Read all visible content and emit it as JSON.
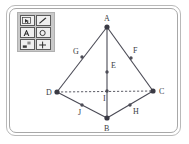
{
  "window": {
    "title": "Geometry Figure Canvas"
  },
  "toolbar": {
    "name": "drawing-tools-palette",
    "rows": [
      [
        {
          "id": "select",
          "icon": "select-arrow-icon",
          "label": "Select"
        },
        {
          "id": "pencil",
          "icon": "pencil-icon",
          "label": "Pencil"
        }
      ],
      [
        {
          "id": "text",
          "icon": "text-a-icon",
          "label": "Text"
        },
        {
          "id": "ellipse",
          "icon": "circle-icon",
          "label": "Ellipse"
        }
      ],
      [
        {
          "id": "eraser",
          "icon": "eraser-icon",
          "label": "Eraser"
        },
        {
          "id": "move",
          "icon": "move-cross-icon",
          "label": "Move"
        }
      ]
    ]
  },
  "figure": {
    "type": "tetrahedron-with-midpoints",
    "points": [
      {
        "id": "A",
        "label": "A",
        "x": 107,
        "y": 27,
        "lx": 104,
        "ly": 21,
        "kind": "major"
      },
      {
        "id": "B",
        "label": "B",
        "x": 107,
        "y": 118,
        "lx": 104,
        "ly": 131,
        "kind": "major"
      },
      {
        "id": "C",
        "label": "C",
        "x": 153,
        "y": 91,
        "lx": 159,
        "ly": 94,
        "kind": "major"
      },
      {
        "id": "D",
        "label": "D",
        "x": 57,
        "y": 92,
        "lx": 46,
        "ly": 95,
        "kind": "major"
      },
      {
        "id": "E",
        "label": "E",
        "x": 107,
        "y": 72,
        "lx": 111,
        "ly": 68,
        "kind": "minor"
      },
      {
        "id": "F",
        "label": "F",
        "x": 131,
        "y": 58,
        "lx": 133,
        "ly": 53,
        "kind": "minor"
      },
      {
        "id": "G",
        "label": "G",
        "x": 82,
        "y": 57,
        "lx": 73,
        "ly": 54,
        "kind": "minor"
      },
      {
        "id": "H",
        "label": "H",
        "x": 130,
        "y": 105,
        "lx": 133,
        "ly": 114,
        "kind": "minor"
      },
      {
        "id": "I",
        "label": "I",
        "x": 107,
        "y": 91,
        "lx": 103,
        "ly": 101,
        "kind": "minor"
      },
      {
        "id": "J",
        "label": "J",
        "x": 82,
        "y": 105,
        "lx": 78,
        "ly": 115,
        "kind": "minor"
      }
    ],
    "edges": [
      {
        "from": "A",
        "to": "D",
        "style": "solid"
      },
      {
        "from": "A",
        "to": "C",
        "style": "solid"
      },
      {
        "from": "A",
        "to": "B",
        "style": "solid"
      },
      {
        "from": "D",
        "to": "B",
        "style": "solid"
      },
      {
        "from": "B",
        "to": "C",
        "style": "solid"
      },
      {
        "from": "D",
        "to": "C",
        "style": "dashed"
      }
    ],
    "colors": {
      "line": "#4a4a55",
      "vertex": "#3a3a44",
      "label": "#3a3a42"
    }
  }
}
